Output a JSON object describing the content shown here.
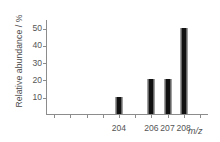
{
  "chart_data": {
    "type": "bar",
    "title": "",
    "subtitle": "",
    "xlabel": "m/z",
    "ylabel": "Relative abundance / %",
    "categories": [
      204,
      206,
      207,
      208
    ],
    "values": [
      10,
      20,
      20,
      50
    ],
    "bars": [
      {
        "x": 204,
        "value": 10,
        "label": "204"
      },
      {
        "x": 206,
        "value": 20,
        "label": "206"
      },
      {
        "x": 207,
        "value": 20,
        "label": "207"
      },
      {
        "x": 208,
        "value": 50,
        "label": "208"
      }
    ],
    "ylim": [
      0,
      55
    ],
    "yticks": [
      10,
      20,
      30,
      40,
      50
    ],
    "ytick_labels": [
      "10",
      "20",
      "30",
      "40",
      "50"
    ],
    "xlim": [
      199.5,
      209.5
    ],
    "xticks": [
      200,
      201,
      202,
      203,
      204,
      205,
      206,
      207,
      208,
      209
    ],
    "xtick_labels": [
      "204",
      "206",
      "207",
      "208"
    ],
    "labeled_xticks": [
      204,
      206,
      207,
      208
    ],
    "grid": false,
    "legend": false,
    "legend_position": "none",
    "bar_color": "#111111",
    "axis_color": "#8c8c8c",
    "text_color": "#555555"
  }
}
